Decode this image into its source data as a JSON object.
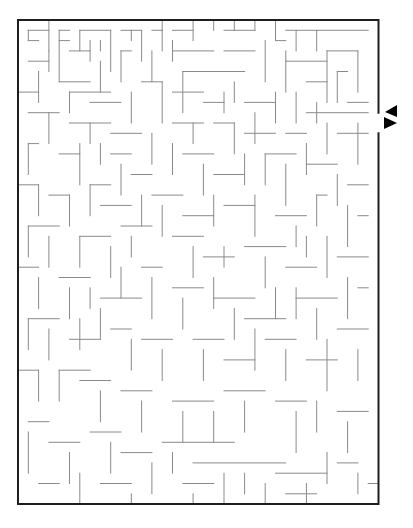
{
  "maze": {
    "origin": [
      18,
      20
    ],
    "cell": 10.3,
    "cols": 35,
    "rows": 47,
    "colors": {
      "wall": "#8a8a8a",
      "border": "#1e1e1e",
      "arrow": "#000000",
      "background": "#ffffff"
    },
    "border_gap_right": {
      "row_from": 9,
      "row_to": 10
    },
    "entry_arrow": {
      "direction": "left",
      "points": "397,105 385,112 397,117"
    },
    "exit_arrow": {
      "direction": "right",
      "points": "384,117 397,123 384,129"
    },
    "walls": [
      [
        1,
        1,
        3,
        1
      ],
      [
        1,
        1,
        1,
        2
      ],
      [
        1,
        2,
        2,
        2
      ],
      [
        3,
        0,
        3,
        3
      ],
      [
        5,
        1,
        4,
        1
      ],
      [
        4,
        1,
        4,
        6
      ],
      [
        4,
        2,
        5,
        2
      ],
      [
        6,
        1,
        9,
        1
      ],
      [
        6,
        1,
        6,
        3
      ],
      [
        7,
        2,
        7,
        4
      ],
      [
        8,
        2,
        8,
        3
      ],
      [
        9,
        1,
        9,
        5
      ],
      [
        10,
        1,
        12,
        1
      ],
      [
        11,
        1,
        11,
        2
      ],
      [
        12,
        1,
        12,
        4
      ],
      [
        13,
        1,
        14,
        1
      ],
      [
        14,
        0,
        14,
        1
      ],
      [
        14,
        1,
        14,
        3
      ],
      [
        15,
        1,
        17,
        1
      ],
      [
        17,
        0,
        17,
        2
      ],
      [
        19,
        0,
        19,
        1
      ],
      [
        20,
        1,
        23,
        1
      ],
      [
        21,
        0,
        21,
        1
      ],
      [
        23,
        0,
        23,
        1
      ],
      [
        25,
        0,
        25,
        2
      ],
      [
        26,
        1,
        34,
        1
      ],
      [
        27,
        1,
        27,
        3
      ],
      [
        29,
        1,
        29,
        3
      ],
      [
        25,
        2,
        26,
        2
      ],
      [
        1,
        4,
        3,
        4
      ],
      [
        3,
        3,
        3,
        5
      ],
      [
        5,
        3,
        7,
        3
      ],
      [
        8,
        4,
        8,
        7
      ],
      [
        10,
        3,
        10,
        6
      ],
      [
        10,
        3,
        11,
        3
      ],
      [
        13,
        3,
        13,
        6
      ],
      [
        15,
        2,
        15,
        4
      ],
      [
        15,
        3,
        19,
        3
      ],
      [
        16,
        5,
        22,
        5
      ],
      [
        20,
        3,
        23,
        3
      ],
      [
        24,
        2,
        24,
        6
      ],
      [
        26,
        3,
        26,
        7
      ],
      [
        26,
        4,
        30,
        4
      ],
      [
        28,
        6,
        30,
        6
      ],
      [
        30,
        3,
        30,
        8
      ],
      [
        30,
        3,
        33,
        3
      ],
      [
        33,
        3,
        33,
        7
      ],
      [
        31,
        5,
        31,
        8
      ],
      [
        31,
        5,
        32,
        5
      ],
      [
        0,
        7,
        2,
        7
      ],
      [
        2,
        5,
        2,
        8
      ],
      [
        4,
        6,
        7,
        6
      ],
      [
        5,
        7,
        5,
        9
      ],
      [
        5,
        7,
        9,
        7
      ],
      [
        7,
        8,
        10,
        8
      ],
      [
        11,
        7,
        11,
        10
      ],
      [
        12,
        6,
        14,
        6
      ],
      [
        14,
        6,
        14,
        10
      ],
      [
        15,
        7,
        18,
        7
      ],
      [
        16,
        5,
        16,
        9
      ],
      [
        18,
        8,
        20,
        8
      ],
      [
        20,
        7,
        20,
        9
      ],
      [
        21,
        6,
        21,
        8
      ],
      [
        22,
        8,
        25,
        8
      ],
      [
        25,
        7,
        25,
        10
      ],
      [
        27,
        7,
        27,
        10
      ],
      [
        28,
        9,
        34,
        9
      ],
      [
        29,
        8,
        29,
        10
      ],
      [
        32,
        8,
        34,
        8
      ],
      [
        1,
        9,
        4,
        9
      ],
      [
        3,
        9,
        3,
        12
      ],
      [
        5,
        10,
        9,
        10
      ],
      [
        7,
        10,
        7,
        12
      ],
      [
        9,
        11,
        12,
        11
      ],
      [
        13,
        11,
        13,
        14
      ],
      [
        15,
        10,
        18,
        10
      ],
      [
        17,
        10,
        17,
        12
      ],
      [
        19,
        10,
        21,
        10
      ],
      [
        21,
        10,
        21,
        13
      ],
      [
        22,
        11,
        25,
        11
      ],
      [
        23,
        9,
        23,
        12
      ],
      [
        26,
        11,
        28,
        11
      ],
      [
        30,
        10,
        30,
        13
      ],
      [
        31,
        11,
        34,
        11
      ],
      [
        33,
        10,
        33,
        14
      ],
      [
        1,
        12,
        2,
        12
      ],
      [
        1,
        12,
        1,
        15
      ],
      [
        4,
        13,
        6,
        13
      ],
      [
        6,
        12,
        6,
        16
      ],
      [
        8,
        12,
        8,
        14
      ],
      [
        9,
        13,
        11,
        13
      ],
      [
        10,
        14,
        10,
        17
      ],
      [
        11,
        15,
        13,
        15
      ],
      [
        15,
        12,
        15,
        15
      ],
      [
        16,
        13,
        19,
        13
      ],
      [
        18,
        14,
        18,
        17
      ],
      [
        19,
        15,
        22,
        15
      ],
      [
        22,
        13,
        22,
        16
      ],
      [
        24,
        13,
        24,
        16
      ],
      [
        24,
        13,
        27,
        13
      ],
      [
        26,
        14,
        26,
        18
      ],
      [
        28,
        12,
        28,
        15
      ],
      [
        28,
        14,
        31,
        14
      ],
      [
        31,
        15,
        31,
        18
      ],
      [
        32,
        16,
        34,
        16
      ],
      [
        0,
        16,
        2,
        16
      ],
      [
        2,
        16,
        2,
        19
      ],
      [
        3,
        17,
        5,
        17
      ],
      [
        5,
        17,
        5,
        20
      ],
      [
        7,
        16,
        7,
        19
      ],
      [
        7,
        16,
        9,
        16
      ],
      [
        8,
        18,
        11,
        18
      ],
      [
        12,
        17,
        12,
        20
      ],
      [
        13,
        17,
        16,
        17
      ],
      [
        14,
        18,
        14,
        21
      ],
      [
        16,
        19,
        19,
        19
      ],
      [
        19,
        17,
        19,
        20
      ],
      [
        20,
        18,
        23,
        18
      ],
      [
        23,
        17,
        23,
        21
      ],
      [
        25,
        19,
        28,
        19
      ],
      [
        27,
        20,
        27,
        22
      ],
      [
        29,
        17,
        29,
        20
      ],
      [
        29,
        17,
        30,
        17
      ],
      [
        32,
        18,
        32,
        22
      ],
      [
        33,
        19,
        34,
        19
      ],
      [
        1,
        20,
        4,
        20
      ],
      [
        1,
        20,
        1,
        23
      ],
      [
        3,
        21,
        3,
        24
      ],
      [
        6,
        21,
        9,
        21
      ],
      [
        6,
        21,
        6,
        24
      ],
      [
        9,
        22,
        9,
        25
      ],
      [
        10,
        20,
        13,
        20
      ],
      [
        11,
        21,
        11,
        23
      ],
      [
        15,
        21,
        18,
        21
      ],
      [
        17,
        22,
        17,
        25
      ],
      [
        18,
        23,
        21,
        23
      ],
      [
        20,
        22,
        20,
        24
      ],
      [
        22,
        22,
        26,
        22
      ],
      [
        24,
        23,
        24,
        26
      ],
      [
        26,
        24,
        29,
        24
      ],
      [
        28,
        21,
        28,
        23
      ],
      [
        30,
        21,
        30,
        25
      ],
      [
        31,
        23,
        34,
        23
      ],
      [
        0,
        24,
        2,
        24
      ],
      [
        2,
        25,
        2,
        28
      ],
      [
        4,
        25,
        7,
        25
      ],
      [
        5,
        26,
        5,
        29
      ],
      [
        7,
        26,
        7,
        28
      ],
      [
        8,
        27,
        12,
        27
      ],
      [
        10,
        24,
        10,
        27
      ],
      [
        12,
        24,
        14,
        24
      ],
      [
        13,
        25,
        13,
        29
      ],
      [
        15,
        26,
        18,
        26
      ],
      [
        16,
        27,
        16,
        30
      ],
      [
        19,
        25,
        19,
        28
      ],
      [
        19,
        27,
        23,
        27
      ],
      [
        21,
        28,
        21,
        31
      ],
      [
        22,
        29,
        26,
        29
      ],
      [
        25,
        26,
        25,
        29
      ],
      [
        27,
        26,
        27,
        29
      ],
      [
        27,
        27,
        31,
        27
      ],
      [
        29,
        28,
        29,
        31
      ],
      [
        32,
        25,
        32,
        29
      ],
      [
        33,
        26,
        34,
        26
      ],
      [
        1,
        29,
        4,
        29
      ],
      [
        1,
        29,
        1,
        32
      ],
      [
        3,
        30,
        3,
        33
      ],
      [
        5,
        31,
        8,
        31
      ],
      [
        6,
        29,
        6,
        32
      ],
      [
        8,
        28,
        8,
        31
      ],
      [
        9,
        30,
        11,
        30
      ],
      [
        11,
        31,
        11,
        34
      ],
      [
        12,
        31,
        15,
        31
      ],
      [
        14,
        32,
        14,
        35
      ],
      [
        17,
        31,
        20,
        31
      ],
      [
        18,
        32,
        18,
        35
      ],
      [
        20,
        33,
        23,
        33
      ],
      [
        23,
        30,
        23,
        34
      ],
      [
        24,
        31,
        27,
        31
      ],
      [
        26,
        32,
        26,
        35
      ],
      [
        28,
        33,
        31,
        33
      ],
      [
        30,
        31,
        30,
        36
      ],
      [
        31,
        30,
        34,
        30
      ],
      [
        33,
        32,
        33,
        35
      ],
      [
        0,
        34,
        2,
        34
      ],
      [
        2,
        34,
        2,
        37
      ],
      [
        4,
        34,
        4,
        37
      ],
      [
        4,
        34,
        7,
        34
      ],
      [
        6,
        35,
        9,
        35
      ],
      [
        8,
        36,
        8,
        39
      ],
      [
        10,
        36,
        13,
        36
      ],
      [
        12,
        37,
        12,
        40
      ],
      [
        15,
        37,
        19,
        37
      ],
      [
        16,
        38,
        16,
        41
      ],
      [
        19,
        38,
        19,
        41
      ],
      [
        20,
        36,
        24,
        36
      ],
      [
        22,
        37,
        22,
        40
      ],
      [
        25,
        37,
        28,
        37
      ],
      [
        27,
        38,
        27,
        42
      ],
      [
        29,
        37,
        29,
        40
      ],
      [
        31,
        38,
        34,
        38
      ],
      [
        32,
        39,
        32,
        42
      ],
      [
        1,
        39,
        3,
        39
      ],
      [
        1,
        40,
        1,
        44
      ],
      [
        3,
        41,
        6,
        41
      ],
      [
        5,
        42,
        5,
        45
      ],
      [
        7,
        40,
        10,
        40
      ],
      [
        9,
        41,
        9,
        44
      ],
      [
        10,
        42,
        13,
        42
      ],
      [
        13,
        43,
        13,
        46
      ],
      [
        14,
        41,
        21,
        41
      ],
      [
        15,
        42,
        15,
        44
      ],
      [
        17,
        43,
        26,
        43
      ],
      [
        20,
        44,
        20,
        47
      ],
      [
        22,
        44,
        22,
        46
      ],
      [
        24,
        45,
        24,
        47
      ],
      [
        25,
        44,
        30,
        44
      ],
      [
        28,
        45,
        28,
        47
      ],
      [
        30,
        42,
        30,
        45
      ],
      [
        31,
        43,
        33,
        43
      ],
      [
        33,
        44,
        33,
        46
      ],
      [
        2,
        45,
        4,
        45
      ],
      [
        6,
        44,
        6,
        47
      ],
      [
        8,
        45,
        11,
        45
      ],
      [
        11,
        46,
        11,
        47
      ],
      [
        16,
        45,
        19,
        45
      ],
      [
        17,
        46,
        17,
        47
      ],
      [
        26,
        46,
        29,
        46
      ],
      [
        34,
        45,
        35,
        45
      ]
    ]
  },
  "labels": {
    "maze_title": "Maze puzzle",
    "entry_label": "Entrance arrow",
    "exit_label": "Exit arrow"
  }
}
